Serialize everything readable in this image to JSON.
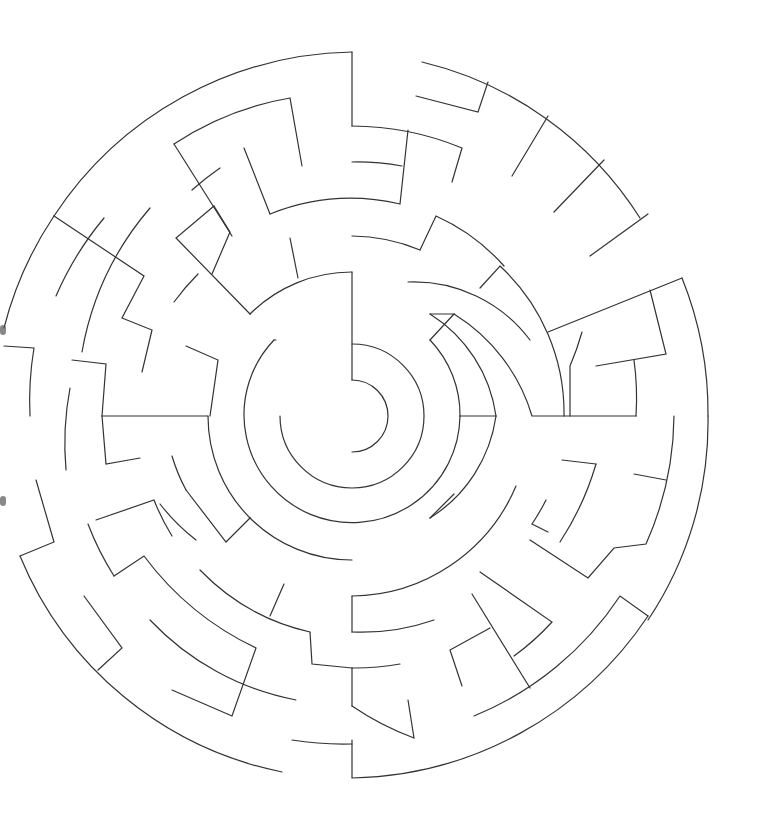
{
  "puzzle": {
    "type": "circular-maze",
    "center": [
      352,
      416
    ],
    "ring_spacing": 36,
    "outer_radius": 360,
    "stroke_color": "#333333",
    "background": "#ffffff",
    "walls": [
      "M352,380 A36,36 0 1,1 352,452",
      "M352,380 L352,272",
      "M352,344 A72,72 0 1,1 280,416",
      "M274,340 A108,108 0 1,0 460,416",
      "M460,416 A108,108 0 0,0 430,340",
      "M276,340 A108,108 0 0,1 274,340",
      "M352,272 A144,144 0 0,0 250,314",
      "M208,416 A144,144 0 0,0 250,518",
      "M250,518 A144,144 0 0,0 352,560",
      "M430,518 A144,144 0 0,0 496,416",
      "M496,416 A144,144 0 0,0 430,314",
      "M250,314 L176,238 L214,206",
      "M430,314 L454,314 L430,340",
      "M430,518 L454,494",
      "M250,518 L226,542 L186,490",
      "M460,416 L496,416",
      "M208,416 L102,416 L106,464 L140,458",
      "M102,416 L106,364 L72,360",
      "M186,346 L218,360 L210,416",
      "M290,238 L298,278",
      "M270,214 A216,216 0 0,1 400,204 L408,130",
      "M270,214 L244,148",
      "M352,126 A290,290 0 0,1 462,148 L452,182",
      "M352,126 L352,52",
      "M352,52 A364,364 0 0,0 54,216",
      "M352,162 A254,254 0 0,1 402,166",
      "M352,236 A180,180 0 0,1 420,250",
      "M420,250 L436,216 A200,200 0 0,1 504,266",
      "M408,282 A145,145 0 0,1 530,340",
      "M454,314 A180,180 0 0,1 532,416 L636,416",
      "M422,62 A356,356 0 0,1 640,218",
      "M488,82 L478,112 L416,96",
      "M548,116 L512,176",
      "M604,160 L554,212",
      "M648,214 L590,256",
      "M480,288 L500,266 A200,200 0 0,1 564,416",
      "M548,332 L682,278",
      "M582,332 A260,260 0 0,1 570,366 L570,416",
      "M650,290 L666,354 L596,366",
      "M634,360 A280,280 0 0,1 636,416",
      "M682,278 A360,360 0 0,1 708,416",
      "M708,416 A356,356 0 0,1 648,620",
      "M674,416 A320,320 0 0,1 646,544 L614,548 L588,578 L530,540",
      "M596,464 L562,460",
      "M596,464 A290,290 0 0,1 560,542",
      "M634,474 L666,480",
      "M548,532 L532,524 A220,220 0 0,0 546,500",
      "M516,486 A180,180 0 0,1 352,596",
      "M352,596 L352,632",
      "M352,632 A220,220 0 0,0 434,620",
      "M480,572 L552,622 A250,250 0 0,1 514,656",
      "M472,594 L530,688",
      "M490,628 L450,650 L462,686",
      "M474,716 A320,320 0 0,0 620,596 L648,616",
      "M352,668 A256,256 0 0,0 400,664",
      "M352,706 A286,286 0 0,0 414,738 L408,700",
      "M352,706 L352,668",
      "M352,744 A320,320 0 0,1 292,740",
      "M352,740 L352,778 A364,364 0 0,0 648,616",
      "M352,668 L312,664 L310,632",
      "M310,632 A220,220 0 0,1 200,570",
      "M284,584 L270,616",
      "M186,490 A180,180 0 0,1 172,456",
      "M160,504 A200,200 0 0,0 196,540",
      "M96,520 L154,500 A220,220 0 0,0 172,536",
      "M88,524 A290,290 0 0,0 114,576",
      "M114,576 L144,556 A300,300 0 0,0 256,648 L232,716 L172,690",
      "M84,596 L122,648 L98,670",
      "M150,620 A270,270 0 0,0 296,700",
      "M20,556 L54,542 L36,480",
      "M20,556 A360,360 0 0,0 282,772",
      "M30,416 A320,320 0 0,1 34,348 L4,346",
      "M66,470 A300,300 0 0,1 70,388",
      "M104,218 A320,320 0 0,0 56,296",
      "M54,216 L144,276 L122,318 L152,330 L142,372",
      "M54,216 A360,360 0 0,0 4,328",
      "M150,208 A300,300 0 0,0 82,352",
      "M174,144 L232,236",
      "M174,144 A300,300 0 0,1 290,98 L302,166",
      "M214,206 L230,232 L212,274",
      "M174,302 A240,240 0 0,1 198,274",
      "M220,168 A280,280 0 0,0 192,190"
    ]
  }
}
